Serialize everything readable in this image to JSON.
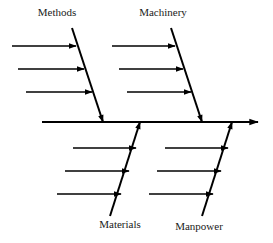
{
  "diagram": {
    "type": "fishbone-ishikawa",
    "title": "",
    "background_color": "#ffffff",
    "line_color": "#000000",
    "label_color": "#1a1a1a",
    "spine": {
      "name": "main-spine",
      "x1": 42,
      "y1": 122,
      "x2": 258,
      "y2": 122,
      "stroke_width": 2.0,
      "arrowhead": "right",
      "arrow_tip_x": 268,
      "arrow_tip_y": 122
    },
    "categories": [
      {
        "id": "methods",
        "label": "Methods",
        "position": "top-left",
        "label_x": 57,
        "label_y": 16,
        "bone": {
          "x1": 72,
          "y1": 28,
          "x2": 103,
          "y2": 122,
          "stroke_width": 2.0,
          "arrow_at": "end"
        },
        "ribs": [
          {
            "y": 46,
            "x_start": 12,
            "x_end": 76
          },
          {
            "y": 69,
            "x_start": 18,
            "x_end": 84
          },
          {
            "y": 92,
            "x_start": 26,
            "x_end": 92
          }
        ]
      },
      {
        "id": "machinery",
        "label": "Machinery",
        "position": "top-right",
        "label_x": 163,
        "label_y": 16,
        "bone": {
          "x1": 171,
          "y1": 28,
          "x2": 202,
          "y2": 122,
          "stroke_width": 2.0,
          "arrow_at": "end"
        },
        "ribs": [
          {
            "y": 46,
            "x_start": 112,
            "x_end": 175
          },
          {
            "y": 69,
            "x_start": 119,
            "x_end": 183
          },
          {
            "y": 92,
            "x_start": 127,
            "x_end": 191
          }
        ]
      },
      {
        "id": "materials",
        "label": "Materials",
        "position": "bottom-left",
        "label_x": 120,
        "label_y": 228,
        "bone": {
          "x1": 110,
          "y1": 216,
          "x2": 140,
          "y2": 122,
          "stroke_width": 2.0,
          "arrow_at": "end"
        },
        "ribs": [
          {
            "y": 148,
            "x_start": 73,
            "x_end": 136
          },
          {
            "y": 171,
            "x_start": 65,
            "x_end": 129
          },
          {
            "y": 194,
            "x_start": 57,
            "x_end": 121
          }
        ]
      },
      {
        "id": "manpower",
        "label": "Manpower",
        "position": "bottom-right",
        "label_x": 199,
        "label_y": 230,
        "bone": {
          "x1": 202,
          "y1": 216,
          "x2": 232,
          "y2": 122,
          "stroke_width": 2.0,
          "arrow_at": "end"
        },
        "ribs": [
          {
            "y": 148,
            "x_start": 165,
            "x_end": 228
          },
          {
            "y": 171,
            "x_start": 157,
            "x_end": 221
          },
          {
            "y": 194,
            "x_start": 149,
            "x_end": 213
          }
        ]
      }
    ]
  }
}
